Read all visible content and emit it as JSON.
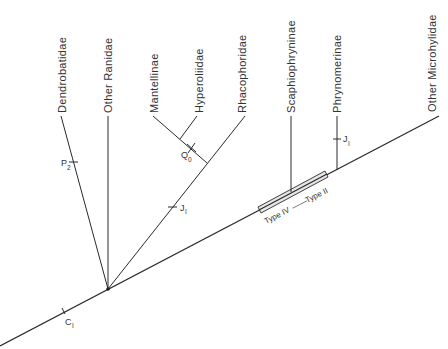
{
  "diagram": {
    "type": "cladogram",
    "taxa": [
      {
        "id": "dendrobatidae",
        "label": "Dendrobatidae"
      },
      {
        "id": "other-ranidae",
        "label": "Other Ranidae"
      },
      {
        "id": "mantellinae",
        "label": "Mantellinae"
      },
      {
        "id": "hyperoliidae",
        "label": "Hyperoliidae"
      },
      {
        "id": "rhacophoridae",
        "label": "Rhacophoridae"
      },
      {
        "id": "scaphiophryninae",
        "label": "Scaphiophryninae"
      },
      {
        "id": "phrynomerinae",
        "label": "Phrynomerinae"
      },
      {
        "id": "other-microhylidae",
        "label": "Other Microhylidae"
      }
    ],
    "character_marks": [
      {
        "id": "p2",
        "letter": "P",
        "sub": "2",
        "branch": "Dendrobatidae"
      },
      {
        "id": "q0",
        "letter": "Q",
        "sub": "0",
        "branch": "Mantellinae + Hyperoliidae"
      },
      {
        "id": "j1-rhaco",
        "letter": "J",
        "sub": "I",
        "branch": "Rhacophoridae lineage"
      },
      {
        "id": "j1-phryno",
        "letter": "J",
        "sub": "I",
        "branch": "Phrynomerinae"
      },
      {
        "id": "c1",
        "letter": "C",
        "sub": "I",
        "branch": "main stem"
      }
    ],
    "transition_box": {
      "left_label": "Type IV",
      "right_label": "Type II",
      "connector": "——"
    }
  }
}
